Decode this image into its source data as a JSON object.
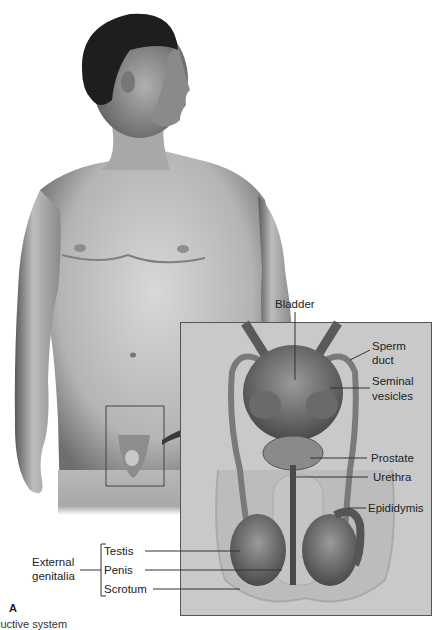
{
  "figure": {
    "panel_letter": "A",
    "caption_fragment": "luctive system",
    "colors": {
      "background": "#ffffff",
      "inset_background": "#c9c9c9",
      "skin": "#bdbdbd",
      "hair": "#1e1e1e",
      "leader_line": "#333333",
      "arrow": "#3a3a3a"
    }
  },
  "labels": {
    "bladder": "Bladder",
    "sperm_duct_1": "Sperm",
    "sperm_duct_2": "duct",
    "seminal_1": "Seminal",
    "seminal_2": "vesicles",
    "prostate": "Prostate",
    "urethra": "Urethra",
    "epididymis": "Epididymis",
    "external_1": "External",
    "external_2": "genitalia",
    "testis": "Testis",
    "penis": "Penis",
    "scrotum": "Scrotum"
  }
}
